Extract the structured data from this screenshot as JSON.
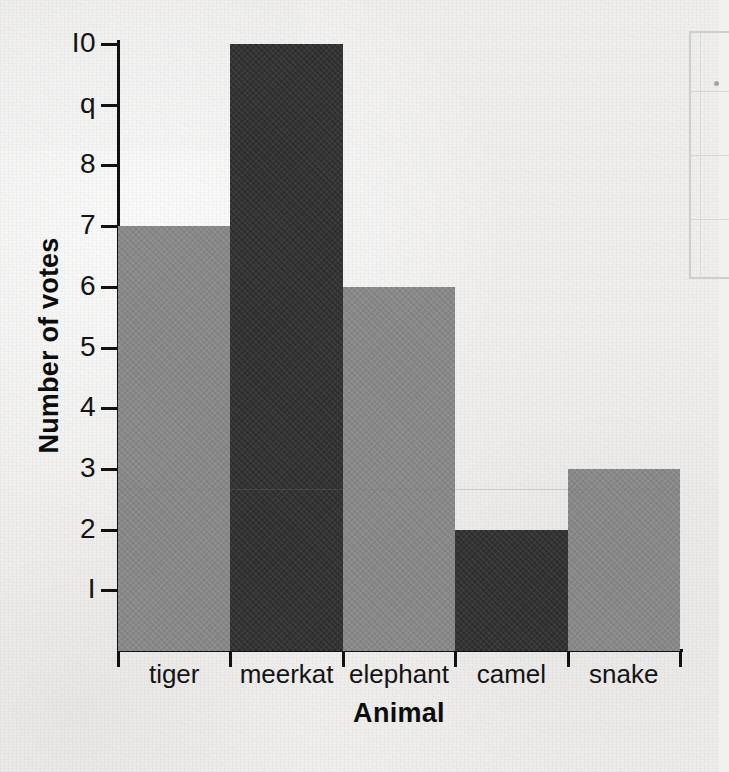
{
  "chart_data": {
    "type": "bar",
    "title": "",
    "xlabel": "Animal",
    "ylabel": "Number of votes",
    "categories": [
      "tiger",
      "meerkat",
      "elephant",
      "camel",
      "snake"
    ],
    "values": [
      7,
      10,
      6,
      2,
      3
    ],
    "ytick_labels": [
      "I",
      "2",
      "3",
      "4",
      "5",
      "6",
      "7",
      "8",
      "q",
      "I0"
    ],
    "ytick_values": [
      1,
      2,
      3,
      4,
      5,
      6,
      7,
      8,
      9,
      10
    ],
    "ylim": [
      0,
      10
    ],
    "grid": false,
    "legend": "none",
    "bar_colors": [
      "#878787",
      "#2e2e2e",
      "#878787",
      "#2e2e2e",
      "#878787"
    ],
    "axis_color": "#111111",
    "background_color": "#f0efee"
  },
  "page": {
    "paper_note": "scanned worksheet paper",
    "edge_fragment_note": "cropped table border at right edge"
  }
}
